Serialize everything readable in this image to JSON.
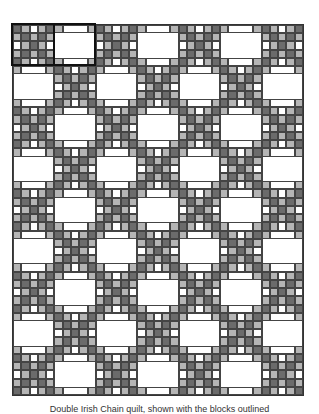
{
  "quilt": {
    "name": "Double Irish Chain",
    "columns": 7,
    "rows": 9,
    "colors": {
      "dark": "#6b6b6b",
      "light": "#b5b5b5",
      "white": "#ffffff",
      "grid": "#444444",
      "outline": "#111111"
    },
    "chain_block": [
      [
        "D",
        "L",
        "W",
        "L",
        "D"
      ],
      [
        "L",
        "D",
        "L",
        "D",
        "L"
      ],
      [
        "W",
        "L",
        "D",
        "L",
        "W"
      ],
      [
        "L",
        "D",
        "L",
        "D",
        "L"
      ],
      [
        "D",
        "L",
        "W",
        "L",
        "D"
      ]
    ],
    "plain_block": "light corner squares with white edge strips and white center",
    "outlined_blocks": [
      {
        "row": 0,
        "col": 0
      },
      {
        "row": 0,
        "col": 1
      }
    ]
  },
  "caption": "Double Irish Chain quilt, shown with the blocks outlined"
}
